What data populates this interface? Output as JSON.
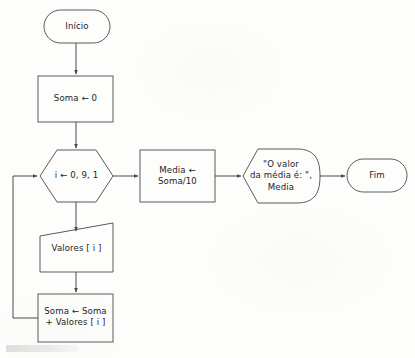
{
  "diagram": {
    "language": "pt-BR",
    "type": "flowchart",
    "stroke_color": "#5a5a5a",
    "text_color": "#1d1d1d",
    "background_color": "#fdfdfc"
  },
  "nodes": {
    "start": {
      "label": "Início",
      "shape": "terminator"
    },
    "init_sum": {
      "label": "Soma ← 0",
      "shape": "process"
    },
    "loop": {
      "label": "i ← 0, 9, 1",
      "shape": "hexagon"
    },
    "input_values": {
      "label": "Valores [ i ]",
      "shape": "trapezoid-input"
    },
    "accumulate": {
      "line1": "Soma ← Soma",
      "line2": "+ Valores [ i ]",
      "shape": "process"
    },
    "mean": {
      "line1": "Media ←",
      "line2": "Soma/10",
      "shape": "process"
    },
    "output": {
      "line1": "\"O valor",
      "line2": "da média é: \",",
      "line3": "Media",
      "shape": "display-output"
    },
    "end": {
      "label": "Fim",
      "shape": "terminator"
    }
  },
  "edges": [
    {
      "name": "start-to-init",
      "from": "start",
      "to": "init_sum",
      "direction": "down"
    },
    {
      "name": "init-to-loop",
      "from": "init_sum",
      "to": "loop",
      "direction": "down"
    },
    {
      "name": "loop-to-input",
      "from": "loop",
      "to": "input_values",
      "direction": "down"
    },
    {
      "name": "input-to-accumulate",
      "from": "input_values",
      "to": "accumulate",
      "direction": "down"
    },
    {
      "name": "accumulate-to-loop",
      "from": "accumulate",
      "to": "loop",
      "direction": "loop-back-left"
    },
    {
      "name": "loop-to-mean",
      "from": "loop",
      "to": "mean",
      "direction": "right"
    },
    {
      "name": "mean-to-output",
      "from": "mean",
      "to": "output",
      "direction": "right"
    },
    {
      "name": "output-to-end",
      "from": "output",
      "to": "end",
      "direction": "right"
    }
  ]
}
